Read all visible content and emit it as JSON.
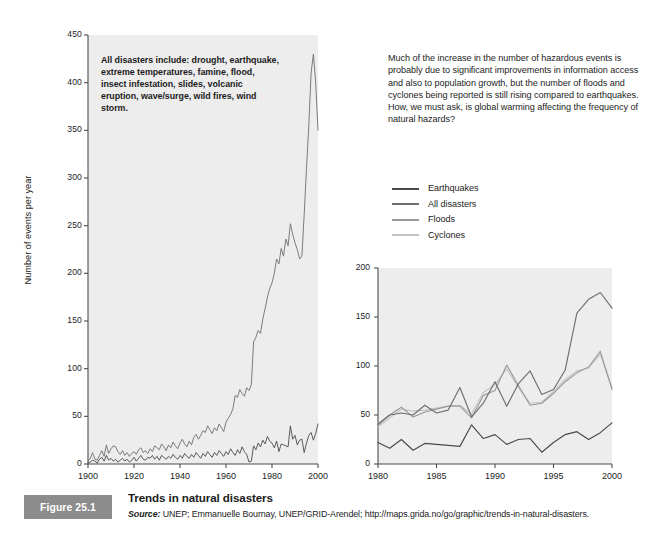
{
  "figure": {
    "badge": "Figure 25.1",
    "title": "Trends in natural disasters",
    "source_keyword": "Source:",
    "source_rest": " UNEP; Emmanuelle Bournay, UNEP/GRID-Arendel; http://maps.grida.no/go/graphic/trends-in-natural-disasters."
  },
  "annotation": "All disasters include: drought, earthquake, extreme temperatures, famine, flood, insect infestation, slides, volcanic eruption, wave/surge, wild fires, wind storm.",
  "intro_text": "Much of the increase in the number of hazardous events is probably due to significant improvements in information access and also to population growth, but the number of floods and cyclones being reported is still rising compared to earthquakes. How, we must ask, is global warming affecting the frequency of natural hazards?",
  "legend": {
    "items": [
      {
        "label": "Earthquakes",
        "color": "#4a4a4a"
      },
      {
        "label": "All disasters",
        "color": "#6e6e6e"
      },
      {
        "label": "Floods",
        "color": "#9a9a9a"
      },
      {
        "label": "Cyclones",
        "color": "#c2c2c2"
      }
    ]
  },
  "colors": {
    "plot_background": "#ededed",
    "badge_background": "#8c8c8c",
    "axis": "#4d4d4d",
    "text": "#1c1c1c"
  },
  "chart_data": [
    {
      "id": "main",
      "type": "line",
      "title": "",
      "xlabel": "",
      "ylabel": "Number of events per year",
      "xlim": [
        1900,
        2000
      ],
      "ylim": [
        0,
        450
      ],
      "yticks": [
        0,
        50,
        100,
        150,
        200,
        250,
        300,
        350,
        400,
        450
      ],
      "xticks": [
        1900,
        1920,
        1940,
        1960,
        1980,
        2000
      ],
      "grid": false,
      "legend_position": "external-right",
      "x": [
        1900,
        1901,
        1902,
        1903,
        1904,
        1905,
        1906,
        1907,
        1908,
        1909,
        1910,
        1911,
        1912,
        1913,
        1914,
        1915,
        1916,
        1917,
        1918,
        1919,
        1920,
        1921,
        1922,
        1923,
        1924,
        1925,
        1926,
        1927,
        1928,
        1929,
        1930,
        1931,
        1932,
        1933,
        1934,
        1935,
        1936,
        1937,
        1938,
        1939,
        1940,
        1941,
        1942,
        1943,
        1944,
        1945,
        1946,
        1947,
        1948,
        1949,
        1950,
        1951,
        1952,
        1953,
        1954,
        1955,
        1956,
        1957,
        1958,
        1959,
        1960,
        1961,
        1962,
        1963,
        1964,
        1965,
        1966,
        1967,
        1968,
        1969,
        1970,
        1971,
        1972,
        1973,
        1974,
        1975,
        1976,
        1977,
        1978,
        1979,
        1980,
        1981,
        1982,
        1983,
        1984,
        1985,
        1986,
        1987,
        1988,
        1989,
        1990,
        1991,
        1992,
        1993,
        1994,
        1995,
        1996,
        1997,
        1998,
        1999,
        2000
      ],
      "series": [
        {
          "name": "All disasters",
          "color": "#6e6e6e",
          "values": [
            3,
            6,
            12,
            5,
            4,
            9,
            14,
            8,
            20,
            11,
            16,
            19,
            18,
            13,
            10,
            14,
            9,
            12,
            8,
            11,
            13,
            10,
            15,
            17,
            12,
            14,
            11,
            16,
            13,
            19,
            17,
            15,
            21,
            18,
            14,
            20,
            17,
            23,
            19,
            16,
            22,
            26,
            21,
            18,
            24,
            20,
            28,
            31,
            26,
            30,
            35,
            33,
            40,
            36,
            32,
            38,
            35,
            42,
            38,
            34,
            44,
            48,
            52,
            58,
            72,
            70,
            78,
            74,
            71,
            80,
            77,
            83,
            128,
            133,
            140,
            137,
            152,
            163,
            175,
            184,
            190,
            200,
            215,
            210,
            226,
            218,
            236,
            229,
            252,
            241,
            232,
            225,
            215,
            218,
            262,
            310,
            355,
            410,
            430,
            400,
            350
          ]
        },
        {
          "name": "Earthquakes",
          "color": "#4a4a4a",
          "values": [
            1,
            2,
            4,
            3,
            1,
            5,
            7,
            3,
            9,
            4,
            6,
            3,
            5,
            2,
            4,
            6,
            3,
            5,
            2,
            4,
            7,
            3,
            6,
            9,
            5,
            4,
            7,
            6,
            9,
            5,
            8,
            4,
            9,
            7,
            5,
            8,
            6,
            10,
            7,
            5,
            9,
            6,
            11,
            8,
            6,
            10,
            7,
            12,
            9,
            6,
            11,
            8,
            13,
            10,
            7,
            12,
            9,
            14,
            11,
            8,
            13,
            10,
            16,
            12,
            9,
            15,
            11,
            18,
            13,
            10,
            2,
            3,
            19,
            15,
            22,
            18,
            25,
            21,
            29,
            24,
            22,
            17,
            24,
            13,
            21,
            20,
            19,
            18,
            40,
            26,
            30,
            20,
            25,
            26,
            12,
            22,
            30,
            33,
            25,
            32,
            42
          ]
        }
      ]
    },
    {
      "id": "inset",
      "type": "line",
      "title": "",
      "xlabel": "",
      "ylabel": "",
      "xlim": [
        1980,
        2000
      ],
      "ylim": [
        0,
        200
      ],
      "yticks": [
        0,
        50,
        100,
        150,
        200
      ],
      "xticks": [
        1980,
        1985,
        1990,
        1995,
        2000
      ],
      "grid": false,
      "legend_position": "external-above",
      "x": [
        1980,
        1981,
        1982,
        1983,
        1984,
        1985,
        1986,
        1987,
        1988,
        1989,
        1990,
        1991,
        1992,
        1993,
        1994,
        1995,
        1996,
        1997,
        1998,
        1999,
        2000
      ],
      "series": [
        {
          "name": "All disasters",
          "color": "#6e6e6e",
          "values": [
            40,
            50,
            52,
            50,
            60,
            52,
            55,
            78,
            48,
            62,
            84,
            59,
            82,
            95,
            71,
            76,
            96,
            154,
            168,
            175,
            159
          ]
        },
        {
          "name": "Floods",
          "color": "#9a9a9a",
          "values": [
            41,
            50,
            58,
            48,
            53,
            56,
            59,
            59,
            47,
            70,
            75,
            101,
            80,
            60,
            62,
            72,
            84,
            93,
            99,
            115,
            76
          ]
        },
        {
          "name": "Cyclones",
          "color": "#c2c2c2",
          "values": [
            38,
            47,
            56,
            54,
            55,
            57,
            59,
            60,
            51,
            73,
            81,
            97,
            78,
            62,
            63,
            74,
            86,
            95,
            98,
            112,
            78
          ]
        },
        {
          "name": "Earthquakes",
          "color": "#4a4a4a",
          "values": [
            22,
            16,
            25,
            14,
            21,
            20,
            19,
            18,
            40,
            26,
            30,
            20,
            25,
            26,
            12,
            22,
            30,
            33,
            25,
            32,
            42
          ]
        }
      ]
    }
  ]
}
